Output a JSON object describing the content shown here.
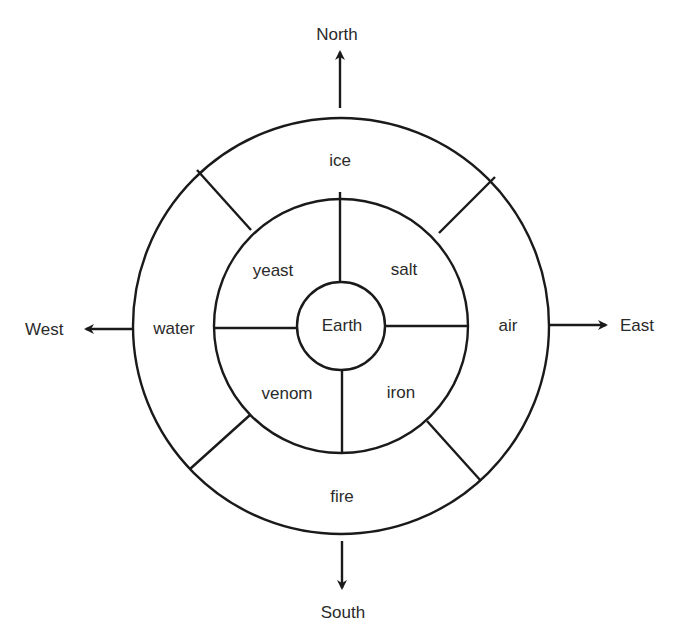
{
  "diagram": {
    "directions": {
      "north": "North",
      "south": "South",
      "east": "East",
      "west": "West"
    },
    "center": {
      "label": "Earth"
    },
    "inner_ring": {
      "north_west": "yeast",
      "north_east": "salt",
      "south_west": "venom",
      "south_east": "iron"
    },
    "outer_ring": {
      "north": "ice",
      "south": "fire",
      "east": "air",
      "west": "water"
    },
    "colors": {
      "line": "#1a1a1a",
      "text": "#2a2a2a",
      "background": "#ffffff"
    }
  }
}
